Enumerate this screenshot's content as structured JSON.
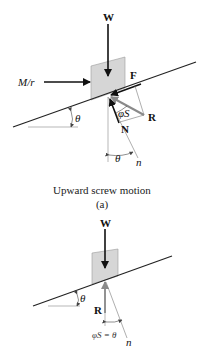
{
  "figure_a": {
    "labels": {
      "weight": "W",
      "moment": "M/r",
      "friction": "F",
      "resultant": "R",
      "normal": "N",
      "friction_angle": "φS",
      "incline_angle": "θ",
      "normal_axis_angle": "θ",
      "normal_axis": "n"
    },
    "caption": "Upward screw motion",
    "tag": "(a)"
  },
  "figure_b": {
    "labels": {
      "weight": "W",
      "resultant": "R",
      "incline_angle": "θ",
      "condition": "φS = θ",
      "normal_axis": "n"
    }
  },
  "colors": {
    "block_fill": "#d6d6d6",
    "line": "#222222",
    "resultant_arrow": "#8a8a8a"
  }
}
